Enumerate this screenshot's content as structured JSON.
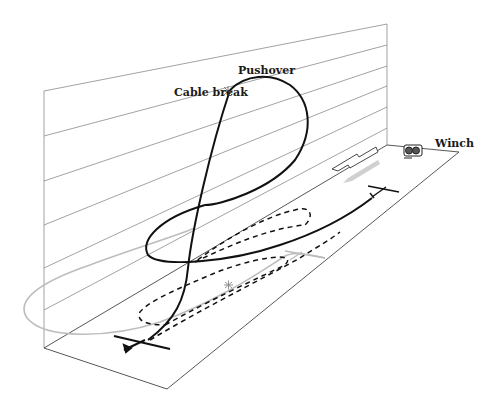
{
  "diagram": {
    "labels": {
      "cable_break": "Cable break",
      "pushover": "Pushover",
      "winch": "Winch"
    },
    "elements": {
      "wall": "vertical-reference-plane",
      "ground": "runway-ground-plane",
      "flight_paths": [
        {
          "name": "high-break-path",
          "style": "solid",
          "color": "#111111"
        },
        {
          "name": "low-break-path",
          "style": "dashed",
          "color": "#111111"
        },
        {
          "name": "circuit-path",
          "style": "solid",
          "color": "#bbbbbb"
        }
      ],
      "wind_arrows": [
        {
          "name": "outline-arrow",
          "color": "#333333"
        },
        {
          "name": "gray-arrow",
          "color": "#cccccc"
        }
      ]
    },
    "colors": {
      "line": "#111111",
      "grid": "#888888",
      "light": "#bbbbbb"
    }
  }
}
